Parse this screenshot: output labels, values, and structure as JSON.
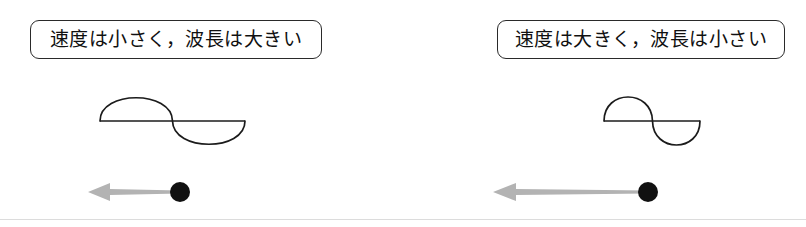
{
  "figure": {
    "width": 806,
    "height": 227,
    "background_color": "#ffffff",
    "line_color": "#1b1b1b",
    "arrow_color": "#b3b3b3",
    "dot_color": "#111111",
    "border_color": "#2a2a2a"
  },
  "panels": [
    {
      "id": "slow",
      "caption": "速度は小さく，波長は大きい",
      "wave": {
        "wavelength_px": 145,
        "amplitude_px": 29,
        "cycles": 1,
        "description": "long-wavelength sine wave"
      },
      "arrow": {
        "direction": "left",
        "length_px": 92,
        "description": "short velocity arrow"
      },
      "particle": {
        "radius_px": 10
      }
    },
    {
      "id": "fast",
      "caption": "速度は大きく，波長は小さい",
      "wave": {
        "wavelength_px": 92,
        "amplitude_px": 29,
        "cycles": 1,
        "description": "short-wavelength sine wave"
      },
      "arrow": {
        "direction": "left",
        "length_px": 155,
        "description": "long velocity arrow"
      },
      "particle": {
        "radius_px": 10
      }
    }
  ]
}
